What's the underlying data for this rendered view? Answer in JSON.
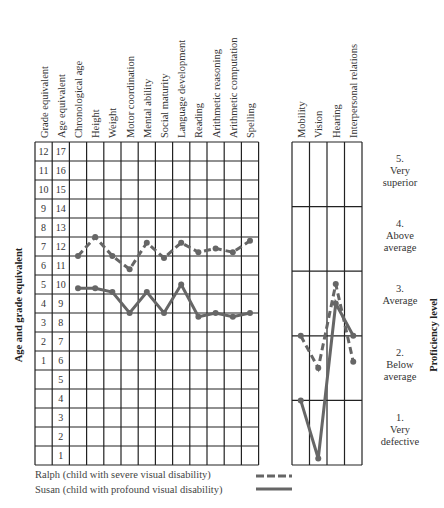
{
  "chart_data": {
    "type": "line",
    "title": "",
    "ylabel_left": "Age and grade equivalent",
    "ylabel_right": "Proficiency level",
    "left_panel": {
      "fixed_columns": [
        "Grade equivalent",
        "Age equivalent"
      ],
      "categories": [
        "Chronological age",
        "Height",
        "Weight",
        "Motor coordination",
        "Mental ability",
        "Social maturity",
        "Language development",
        "Reading",
        "Arithmetic reasoning",
        "Arithmetic computation",
        "Spelling"
      ],
      "grade_ticks": [
        "12",
        "11",
        "10",
        "9",
        "8",
        "7",
        "6",
        "5",
        "4",
        "3",
        "2",
        "1",
        "",
        "",
        "",
        "",
        ""
      ],
      "age_ticks": [
        "17",
        "16",
        "15",
        "14",
        "13",
        "12",
        "11",
        "10",
        "9",
        "8",
        "7",
        "6",
        "5",
        "4",
        "3",
        "2",
        "1"
      ],
      "ylim": [
        0,
        17
      ],
      "series": [
        {
          "name": "Ralph (child with severe visual disability)",
          "style": "dashed",
          "values": [
            11.0,
            12.0,
            11.0,
            10.3,
            11.7,
            10.9,
            11.7,
            11.2,
            11.4,
            11.2,
            11.8
          ]
        },
        {
          "name": "Susan (child with profound visual disability)",
          "style": "solid",
          "values": [
            9.3,
            9.3,
            9.1,
            8.0,
            9.1,
            8.0,
            9.5,
            7.8,
            8.0,
            7.8,
            8.0
          ]
        }
      ]
    },
    "right_panel": {
      "categories": [
        "Mobility",
        "Vision",
        "Hearing",
        "Interpersonal relations"
      ],
      "levels": [
        {
          "num": "5.",
          "label": "Very superior"
        },
        {
          "num": "4.",
          "label": "Above average"
        },
        {
          "num": "3.",
          "label": "Average"
        },
        {
          "num": "2.",
          "label": "Below average"
        },
        {
          "num": "1.",
          "label": "Very defective"
        }
      ],
      "ylim": [
        0,
        5
      ],
      "series": [
        {
          "name": "Ralph (child with severe visual disability)",
          "style": "dashed",
          "values": [
            2.0,
            1.5,
            2.8,
            1.6
          ]
        },
        {
          "name": "Susan (child with profound visual disability)",
          "style": "solid",
          "values": [
            1.0,
            0.1,
            2.5,
            2.0
          ]
        }
      ]
    },
    "legend": [
      {
        "label": "Ralph (child with severe visual disability)",
        "style": "dashed"
      },
      {
        "label": "Susan (child with profound visual disability)",
        "style": "solid"
      }
    ],
    "line_color": "#666666"
  }
}
